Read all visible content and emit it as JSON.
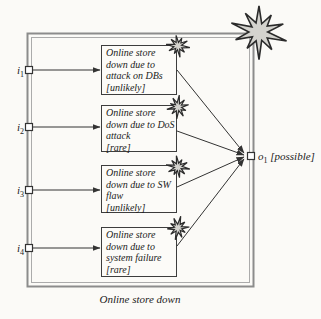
{
  "diagram": {
    "caption": "Online store down",
    "inputs": [
      {
        "name": "i",
        "sub": "1"
      },
      {
        "name": "i",
        "sub": "2"
      },
      {
        "name": "i",
        "sub": "3"
      },
      {
        "name": "i",
        "sub": "4"
      }
    ],
    "output": {
      "name": "o",
      "sub": "1",
      "value": "[possible]"
    },
    "threat_scenarios": [
      {
        "lines": [
          "Online store",
          "down due to",
          "attack on DBs",
          "[unlikely]"
        ]
      },
      {
        "lines": [
          "Online store",
          "down due to DoS",
          "attack",
          "[rare]"
        ]
      },
      {
        "lines": [
          "Online store",
          "down due to SW",
          "flaw",
          "[unlikely]"
        ]
      },
      {
        "lines": [
          "Online store",
          "down due to",
          "system failure",
          "[rare]"
        ]
      }
    ]
  },
  "colors": {
    "bg": "#fbfaf7",
    "box_bg": "#fcfbf8",
    "box_border": "#3d3d3d",
    "line": "#333333",
    "frame": "#8c8c8c",
    "frame_light": "#ababab",
    "star_fill": "#d4d3ce",
    "star_stroke": "#2b2b2b",
    "text": "#1b1b1b"
  }
}
